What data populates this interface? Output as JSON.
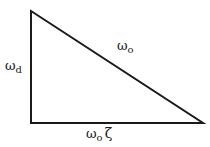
{
  "diagram": {
    "type": "right-triangle",
    "stroke_color": "#1a1a1a",
    "background": "#ffffff",
    "vertices": {
      "top_left": [
        31,
        11
      ],
      "bottom_left": [
        31,
        123
      ],
      "bottom_right": [
        203,
        123
      ]
    },
    "labels": {
      "hypotenuse": {
        "symbol": "ω",
        "subscript": "o"
      },
      "vertical_side": {
        "symbol": "ω",
        "subscript": "d"
      },
      "horizontal_side": {
        "symbol": "ω",
        "subscript": "o",
        "suffix": "ζ"
      }
    }
  }
}
